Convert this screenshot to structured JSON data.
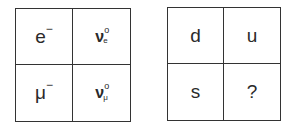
{
  "left_grid": {
    "cells": [
      {
        "symbol": "e",
        "superscript": "−"
      },
      {
        "symbol": "ν",
        "superscript": "o",
        "subscript": "e"
      },
      {
        "symbol": "μ",
        "superscript": "−"
      },
      {
        "symbol": "ν",
        "superscript": "o",
        "subscript": "μ"
      }
    ]
  },
  "right_grid": {
    "cells": [
      {
        "symbol": "d"
      },
      {
        "symbol": "u"
      },
      {
        "symbol": "s"
      },
      {
        "symbol": "?"
      }
    ]
  }
}
